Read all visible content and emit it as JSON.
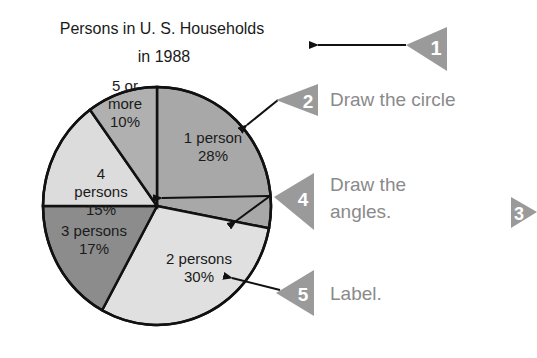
{
  "chart_data": {
    "type": "pie",
    "title_lines": [
      "Persons in U. S. Households",
      "in 1988"
    ],
    "start_angle": "12 o'clock, clockwise",
    "slices": [
      {
        "label": "1 person",
        "percent": 28,
        "color": "#a8a8a8",
        "label_lines": [
          "1 person",
          "28%"
        ]
      },
      {
        "label": "2 persons",
        "percent": 30,
        "color": "#e0e0e0",
        "label_lines": [
          "2 persons",
          "30%"
        ]
      },
      {
        "label": "3 persons",
        "percent": 17,
        "color": "#8c8c8c",
        "label_lines": [
          "3 persons",
          "17%"
        ]
      },
      {
        "label": "4 persons",
        "percent": 15,
        "color": "#dcdcdc",
        "label_lines": [
          "4",
          "persons",
          "15%"
        ]
      },
      {
        "label": "5 or more",
        "percent": 10,
        "color": "#b0b0b0",
        "label_lines": [
          "5 or",
          "more",
          "10%"
        ]
      }
    ]
  },
  "annotations": {
    "badge_color": "#9a9a9a",
    "text_color": "#8a8a8a",
    "steps": [
      {
        "number": "1",
        "text": ""
      },
      {
        "number": "2",
        "text": "Draw the circle"
      },
      {
        "number": "3",
        "text": ""
      },
      {
        "number": "4",
        "text_lines": [
          "Draw the",
          "angles."
        ]
      },
      {
        "number": "5",
        "text": "Label."
      }
    ]
  }
}
